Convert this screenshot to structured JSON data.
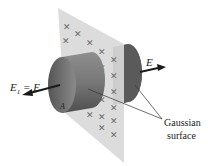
{
  "diagram": {
    "labels": {
      "left_field": "E",
      "left_field_sub": "1",
      "left_field_eq": " = E",
      "right_field": "E",
      "area": "A",
      "gaussian_line1": "Gaussian",
      "gaussian_line2": "surface"
    },
    "charge_symbol": "+",
    "colors": {
      "sheet": "#dcdcdc",
      "cylinder_dark": "#4a4a4a",
      "cylinder_light": "#9a9a9a",
      "charge": "#6a6a6a",
      "arrow": "#1a1a1a"
    }
  }
}
